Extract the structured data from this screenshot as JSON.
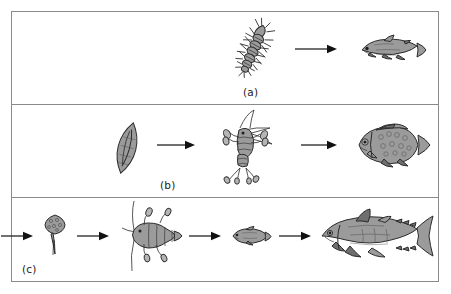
{
  "figure": {
    "border_color": "#8a8a8a",
    "background": "#ffffff",
    "organism_fill": "#9b9b9b",
    "organism_outline": "#2b2b2b",
    "arrow_color": "#111111"
  },
  "panels": [
    {
      "id": "a",
      "label": "(a)",
      "label_align": "center",
      "link_count": 2,
      "arrow_count": 1,
      "organisms": [
        {
          "name": "bristly-larva",
          "label": "bristly segmented larva",
          "role": "prey"
        },
        {
          "name": "trout-fish",
          "label": "trout",
          "role": "predator"
        }
      ]
    },
    {
      "id": "b",
      "label": "(b)",
      "label_align": "center",
      "link_count": 3,
      "arrow_count": 2,
      "organisms": [
        {
          "name": "pennate-diatom",
          "label": "pennate diatom",
          "role": "producer"
        },
        {
          "name": "copepod",
          "label": "copepod",
          "role": "primary consumer"
        },
        {
          "name": "bream-fish",
          "label": "bream",
          "role": "predator"
        }
      ]
    },
    {
      "id": "c",
      "label": "(c)",
      "label_align": "left",
      "link_count": 5,
      "arrow_count": 4,
      "organisms": [
        {
          "name": "centric-diatom",
          "label": "centric diatom",
          "role": "producer"
        },
        {
          "name": "dinoflagellate",
          "label": "stalked flagellate",
          "role": "primary consumer"
        },
        {
          "name": "large-copepod",
          "label": "copepod",
          "role": "secondary consumer"
        },
        {
          "name": "small-fish",
          "label": "small forage fish",
          "role": "tertiary consumer"
        },
        {
          "name": "tuna-fish",
          "label": "tuna",
          "role": "apex predator"
        }
      ]
    }
  ]
}
